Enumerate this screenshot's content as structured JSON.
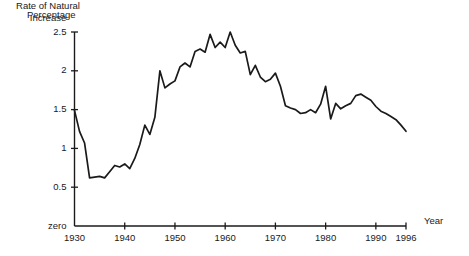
{
  "chart_data": {
    "type": "line",
    "title": "",
    "annotation": "Rate of Natural\nIncrease",
    "annotation_lines": [
      "Rate of Natural",
      "Increase"
    ],
    "ylabel": "Percentage",
    "xlabel": "Year",
    "ylim": [
      0,
      2.5
    ],
    "xlim": [
      1930,
      1996
    ],
    "grid": false,
    "legend_position": "none",
    "ytick_labels": [
      "2.5",
      "2",
      "1.5",
      "1",
      "0.5",
      "zero"
    ],
    "ytick_values": [
      2.5,
      2,
      1.5,
      1,
      0.5,
      0
    ],
    "xtick_labels": [
      "1930",
      "1940",
      "1950",
      "1960",
      "1970",
      "1980",
      "1990",
      "1996"
    ],
    "xtick_values": [
      1930,
      1940,
      1950,
      1960,
      1970,
      1980,
      1990,
      1996
    ],
    "series": [
      {
        "name": "Rate of Natural Increase",
        "color": "#1a1a1a",
        "x": [
          1930,
          1931,
          1932,
          1933,
          1934,
          1935,
          1936,
          1937,
          1938,
          1939,
          1940,
          1941,
          1942,
          1943,
          1944,
          1945,
          1946,
          1947,
          1948,
          1949,
          1950,
          1951,
          1952,
          1953,
          1954,
          1955,
          1956,
          1957,
          1958,
          1959,
          1960,
          1961,
          1962,
          1963,
          1964,
          1965,
          1966,
          1967,
          1968,
          1969,
          1970,
          1971,
          1972,
          1973,
          1974,
          1975,
          1976,
          1977,
          1978,
          1979,
          1980,
          1981,
          1982,
          1983,
          1984,
          1985,
          1986,
          1987,
          1988,
          1989,
          1990,
          1991,
          1992,
          1993,
          1994,
          1995,
          1996
        ],
        "values": [
          1.49,
          1.22,
          1.07,
          0.62,
          0.63,
          0.64,
          0.62,
          0.7,
          0.78,
          0.76,
          0.8,
          0.74,
          0.87,
          1.05,
          1.3,
          1.18,
          1.4,
          2.0,
          1.78,
          1.83,
          1.87,
          2.05,
          2.1,
          2.05,
          2.25,
          2.28,
          2.24,
          2.47,
          2.3,
          2.37,
          2.3,
          2.5,
          2.33,
          2.23,
          2.25,
          1.95,
          2.07,
          1.92,
          1.86,
          1.89,
          1.97,
          1.8,
          1.55,
          1.52,
          1.5,
          1.45,
          1.46,
          1.5,
          1.46,
          1.57,
          1.8,
          1.38,
          1.58,
          1.51,
          1.55,
          1.58,
          1.68,
          1.7,
          1.66,
          1.62,
          1.54,
          1.48,
          1.45,
          1.41,
          1.37,
          1.3,
          1.22
        ]
      }
    ]
  },
  "axes": {
    "y_label": "Percentage",
    "x_label": "Year"
  }
}
